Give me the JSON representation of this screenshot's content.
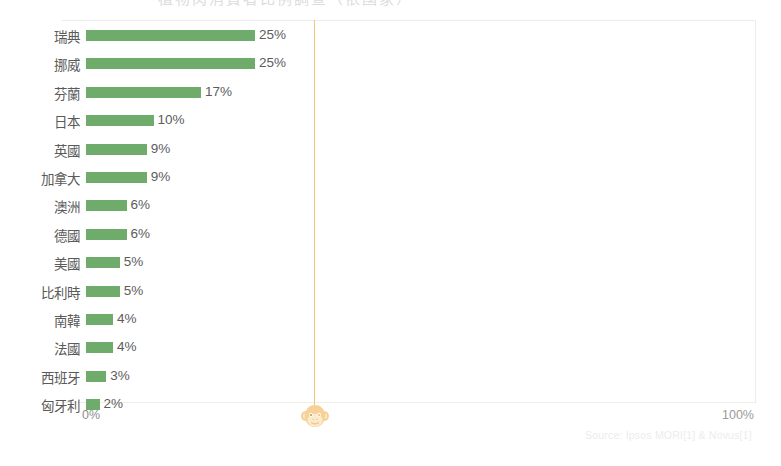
{
  "page": {
    "background_color": "#ffffff",
    "cropped_title_ghost": "植物肉消費者比例調查（依國家）"
  },
  "axis": {
    "left_label": "0%",
    "right_label": "100%"
  },
  "logo": {
    "name": "monkey-face-logo",
    "color": "#f5c97a"
  },
  "source": {
    "text": "Source: Ipsos MORI[1] & Novus[1]"
  },
  "colors": {
    "bar": "#6fab6b",
    "guide_line": "#f2c879",
    "frame": "#ececf0",
    "label_text": "#5a5a5a"
  },
  "chart_data": {
    "type": "bar",
    "orientation": "horizontal",
    "title": "",
    "xlabel": "",
    "ylabel": "",
    "xlim": [
      0,
      100
    ],
    "xticks": [
      "0%",
      "100%"
    ],
    "grid": false,
    "legend": null,
    "annotations": [
      "Source: Ipsos MORI[1] & Novus[1]"
    ],
    "categories": [
      "瑞典",
      "挪威",
      "芬蘭",
      "日本",
      "英國",
      "加拿大",
      "澳洲",
      "德國",
      "美國",
      "比利時",
      "南韓",
      "法國",
      "西班牙",
      "匈牙利"
    ],
    "values": [
      25,
      25,
      17,
      10,
      9,
      9,
      6,
      6,
      5,
      5,
      4,
      4,
      3,
      2
    ],
    "value_labels": [
      "25%",
      "25%",
      "17%",
      "10%",
      "9%",
      "9%",
      "6%",
      "6%",
      "5%",
      "5%",
      "4%",
      "4%",
      "3%",
      "2%"
    ],
    "rows": [
      {
        "label": "瑞典",
        "value": 25,
        "value_label": "25%"
      },
      {
        "label": "挪威",
        "value": 25,
        "value_label": "25%"
      },
      {
        "label": "芬蘭",
        "value": 17,
        "value_label": "17%"
      },
      {
        "label": "日本",
        "value": 10,
        "value_label": "10%"
      },
      {
        "label": "英國",
        "value": 9,
        "value_label": "9%"
      },
      {
        "label": "加拿大",
        "value": 9,
        "value_label": "9%"
      },
      {
        "label": "澳洲",
        "value": 6,
        "value_label": "6%"
      },
      {
        "label": "德國",
        "value": 6,
        "value_label": "6%"
      },
      {
        "label": "美國",
        "value": 5,
        "value_label": "5%"
      },
      {
        "label": "比利時",
        "value": 5,
        "value_label": "5%"
      },
      {
        "label": "南韓",
        "value": 4,
        "value_label": "4%"
      },
      {
        "label": "法國",
        "value": 4,
        "value_label": "4%"
      },
      {
        "label": "西班牙",
        "value": 3,
        "value_label": "3%"
      },
      {
        "label": "匈牙利",
        "value": 2,
        "value_label": "2%"
      }
    ]
  }
}
